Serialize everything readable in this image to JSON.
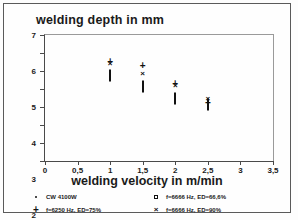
{
  "chart_data": {
    "type": "scatter",
    "title": "welding depth in mm",
    "xlabel": "welding velocity in m/min",
    "ylabel": "welding depth in mm",
    "xlim": [
      0,
      3.5
    ],
    "ylim": [
      0,
      7
    ],
    "xticks": [
      "0",
      "0,5",
      "1",
      "1,5",
      "2",
      "2,5",
      "3",
      "3,5"
    ],
    "xtick_values": [
      0,
      0.5,
      1,
      1.5,
      2,
      2.5,
      3,
      3.5
    ],
    "yticks": [
      "0",
      "1",
      "2",
      "3",
      "4",
      "5",
      "6",
      "7"
    ],
    "ytick_values": [
      0,
      1,
      2,
      3,
      4,
      5,
      6,
      7
    ],
    "grid": false,
    "legend_position": "below",
    "series": [
      {
        "name": "CW 4100W",
        "marker": "dot",
        "points": [
          {
            "x": 1.0,
            "y": 6.1
          },
          {
            "x": 2.0,
            "y": 5.0
          },
          {
            "x": 2.5,
            "y": 4.45
          },
          {
            "x": 3.0,
            "y": 4.0
          },
          {
            "x": 3.3,
            "y": 3.3
          }
        ]
      },
      {
        "name": "f=6250 Hz, ED=75%",
        "marker": "plus",
        "points": [
          {
            "x": 1.0,
            "y": 5.5
          },
          {
            "x": 1.5,
            "y": 5.3
          },
          {
            "x": 2.0,
            "y": 4.3
          },
          {
            "x": 2.5,
            "y": 3.2
          }
        ]
      },
      {
        "name": "f=6666 Hz, ED=66,6%",
        "marker": "square",
        "points": [
          {
            "x": 1.0,
            "y": 4.7
          },
          {
            "x": 1.5,
            "y": 4.1
          },
          {
            "x": 2.0,
            "y": 3.45
          },
          {
            "x": 2.5,
            "y": 3.1
          }
        ]
      },
      {
        "name": "f=6666 Hz, ED=90%",
        "marker": "cross",
        "points": [
          {
            "x": 1.0,
            "y": 5.45
          },
          {
            "x": 1.5,
            "y": 4.9
          },
          {
            "x": 2.0,
            "y": 4.2
          },
          {
            "x": 2.5,
            "y": 3.5
          }
        ]
      }
    ]
  },
  "legend": [
    {
      "label": "CW 4100W",
      "marker": "dot"
    },
    {
      "label": "f=6666 Hz, ED=66,6%",
      "marker": "square"
    },
    {
      "label": "f=6250 Hz, ED=75%",
      "marker": "plus"
    },
    {
      "label": "f=6666 Hz, ED=90%",
      "marker": "cross"
    }
  ]
}
